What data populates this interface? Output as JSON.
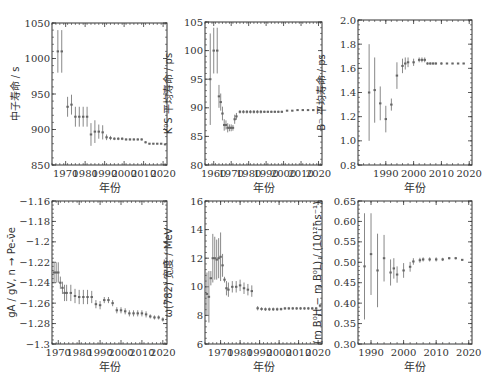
{
  "chart_data": [
    {
      "type": "scatter",
      "id": "neutron",
      "title": "",
      "xlabel": "年份",
      "ylabel": "中子寿命 / s",
      "xlim": [
        1963,
        2022
      ],
      "ylim": [
        850,
        1050
      ],
      "xticks": [
        1970,
        1980,
        1990,
        2000,
        2010,
        2020
      ],
      "yticks": [
        850,
        900,
        950,
        1000,
        1050
      ],
      "points": [
        {
          "x": 1966,
          "y": 1010,
          "err": 30
        },
        {
          "x": 1968,
          "y": 1010,
          "err": 30
        },
        {
          "x": 1971,
          "y": 932,
          "err": 14
        },
        {
          "x": 1973,
          "y": 935,
          "err": 14
        },
        {
          "x": 1975,
          "y": 918,
          "err": 14
        },
        {
          "x": 1977,
          "y": 918,
          "err": 14
        },
        {
          "x": 1979,
          "y": 918,
          "err": 14
        },
        {
          "x": 1981,
          "y": 918,
          "err": 14
        },
        {
          "x": 1983,
          "y": 893,
          "err": 16
        },
        {
          "x": 1985,
          "y": 897,
          "err": 16
        },
        {
          "x": 1987,
          "y": 897,
          "err": 10
        },
        {
          "x": 1989,
          "y": 896,
          "err": 10
        },
        {
          "x": 1991,
          "y": 889,
          "err": 4
        },
        {
          "x": 1993,
          "y": 888,
          "err": 3
        },
        {
          "x": 1995,
          "y": 887,
          "err": 2
        },
        {
          "x": 1997,
          "y": 887,
          "err": 2
        },
        {
          "x": 1999,
          "y": 887,
          "err": 2
        },
        {
          "x": 2001,
          "y": 886,
          "err": 1.5
        },
        {
          "x": 2003,
          "y": 886,
          "err": 1.5
        },
        {
          "x": 2005,
          "y": 886,
          "err": 1.5
        },
        {
          "x": 2007,
          "y": 886,
          "err": 1.5
        },
        {
          "x": 2009,
          "y": 886,
          "err": 1.5
        },
        {
          "x": 2011,
          "y": 882,
          "err": 1.5
        },
        {
          "x": 2013,
          "y": 880,
          "err": 1
        },
        {
          "x": 2015,
          "y": 880,
          "err": 1
        },
        {
          "x": 2017,
          "y": 880,
          "err": 1
        },
        {
          "x": 2019,
          "y": 880,
          "err": 1
        },
        {
          "x": 2021,
          "y": 879,
          "err": 0.6
        }
      ]
    },
    {
      "type": "scatter",
      "id": "ks",
      "title": "",
      "xlabel": "年份",
      "ylabel": "K⁰S 平均寿命 / ps",
      "xlim": [
        1955,
        2022
      ],
      "ylim": [
        80,
        105
      ],
      "xticks": [
        1960,
        1970,
        1980,
        1990,
        2000,
        2010,
        2020
      ],
      "yticks": [
        80,
        85,
        90,
        95,
        100,
        105
      ],
      "points": [
        {
          "x": 1958,
          "y": 95,
          "err": 8
        },
        {
          "x": 1960,
          "y": 100,
          "err": 4
        },
        {
          "x": 1962,
          "y": 100,
          "err": 4
        },
        {
          "x": 1963,
          "y": 92,
          "err": 2
        },
        {
          "x": 1964,
          "y": 91,
          "err": 1.5
        },
        {
          "x": 1965,
          "y": 89,
          "err": 1.2
        },
        {
          "x": 1966,
          "y": 87,
          "err": 1
        },
        {
          "x": 1967,
          "y": 87,
          "err": 0.8
        },
        {
          "x": 1968,
          "y": 86.5,
          "err": 0.8
        },
        {
          "x": 1969,
          "y": 86.5,
          "err": 0.6
        },
        {
          "x": 1970,
          "y": 86.5,
          "err": 0.6
        },
        {
          "x": 1971,
          "y": 86.5,
          "err": 0.5
        },
        {
          "x": 1972,
          "y": 88,
          "err": 0.8
        },
        {
          "x": 1973,
          "y": 88.5,
          "err": 0.6
        },
        {
          "x": 1975,
          "y": 89.3,
          "err": 0.3
        },
        {
          "x": 1977,
          "y": 89.3,
          "err": 0.3
        },
        {
          "x": 1979,
          "y": 89.3,
          "err": 0.3
        },
        {
          "x": 1981,
          "y": 89.3,
          "err": 0.3
        },
        {
          "x": 1983,
          "y": 89.3,
          "err": 0.3
        },
        {
          "x": 1985,
          "y": 89.3,
          "err": 0.3
        },
        {
          "x": 1987,
          "y": 89.3,
          "err": 0.3
        },
        {
          "x": 1989,
          "y": 89.3,
          "err": 0.2
        },
        {
          "x": 1991,
          "y": 89.3,
          "err": 0.2
        },
        {
          "x": 1993,
          "y": 89.3,
          "err": 0.2
        },
        {
          "x": 1995,
          "y": 89.3,
          "err": 0.2
        },
        {
          "x": 1997,
          "y": 89.3,
          "err": 0.2
        },
        {
          "x": 1999,
          "y": 89.3,
          "err": 0.2
        },
        {
          "x": 2002,
          "y": 89.5,
          "err": 0.1
        },
        {
          "x": 2005,
          "y": 89.5,
          "err": 0.1
        },
        {
          "x": 2008,
          "y": 89.6,
          "err": 0.1
        },
        {
          "x": 2011,
          "y": 89.6,
          "err": 0.1
        },
        {
          "x": 2014,
          "y": 89.6,
          "err": 0.1
        },
        {
          "x": 2017,
          "y": 89.6,
          "err": 0.1
        },
        {
          "x": 2020,
          "y": 89.6,
          "err": 0.1
        }
      ]
    },
    {
      "type": "scatter",
      "id": "bminus",
      "title": "",
      "xlabel": "年份",
      "ylabel": "B⁻ 平均寿命 / ps",
      "xlim": [
        1980,
        2021
      ],
      "ylim": [
        0.8,
        2.0
      ],
      "xticks": [
        1990,
        2000,
        2010,
        2020
      ],
      "yticks": [
        0.8,
        1.0,
        1.2,
        1.4,
        1.6,
        1.8,
        2.0
      ],
      "points": [
        {
          "x": 1984,
          "y": 1.4,
          "err": 0.4
        },
        {
          "x": 1986,
          "y": 1.42,
          "err": 0.27
        },
        {
          "x": 1988,
          "y": 1.31,
          "err": 0.14
        },
        {
          "x": 1990,
          "y": 1.18,
          "err": 0.11
        },
        {
          "x": 1992,
          "y": 1.3,
          "err": 0.05
        },
        {
          "x": 1994,
          "y": 1.54,
          "err": 0.11
        },
        {
          "x": 1996,
          "y": 1.62,
          "err": 0.06
        },
        {
          "x": 1997,
          "y": 1.64,
          "err": 0.05
        },
        {
          "x": 1998,
          "y": 1.65,
          "err": 0.04
        },
        {
          "x": 2000,
          "y": 1.65,
          "err": 0.03
        },
        {
          "x": 2002,
          "y": 1.67,
          "err": 0.02
        },
        {
          "x": 2003,
          "y": 1.67,
          "err": 0.02
        },
        {
          "x": 2004,
          "y": 1.67,
          "err": 0.02
        },
        {
          "x": 2005,
          "y": 1.64,
          "err": 0.01
        },
        {
          "x": 2006,
          "y": 1.64,
          "err": 0.01
        },
        {
          "x": 2007,
          "y": 1.64,
          "err": 0.01
        },
        {
          "x": 2008,
          "y": 1.64,
          "err": 0.01
        },
        {
          "x": 2010,
          "y": 1.64,
          "err": 0.01
        },
        {
          "x": 2012,
          "y": 1.64,
          "err": 0.005
        },
        {
          "x": 2014,
          "y": 1.64,
          "err": 0.005
        },
        {
          "x": 2016,
          "y": 1.64,
          "err": 0.005
        },
        {
          "x": 2018,
          "y": 1.64,
          "err": 0.005
        }
      ]
    },
    {
      "type": "scatter",
      "id": "gagv",
      "title": "",
      "xlabel": "年份",
      "ylabel": "gA / gV, n → Pe-ν̄e",
      "xlim": [
        1967,
        2022
      ],
      "ylim": [
        -1.3,
        -1.16
      ],
      "xticks": [
        1970,
        1980,
        1990,
        2000,
        2010,
        2020
      ],
      "yticks": [
        -1.3,
        -1.28,
        -1.26,
        -1.24,
        -1.22,
        -1.2,
        -1.18,
        -1.16
      ],
      "points": [
        {
          "x": 1968,
          "y": -1.23,
          "err": 0.01
        },
        {
          "x": 1969,
          "y": -1.23,
          "err": 0.01
        },
        {
          "x": 1970,
          "y": -1.23,
          "err": 0.01
        },
        {
          "x": 1971,
          "y": -1.24,
          "err": 0.006
        },
        {
          "x": 1972,
          "y": -1.245,
          "err": 0.006
        },
        {
          "x": 1973,
          "y": -1.25,
          "err": 0.008
        },
        {
          "x": 1974,
          "y": -1.25,
          "err": 0.008
        },
        {
          "x": 1976,
          "y": -1.25,
          "err": 0.008
        },
        {
          "x": 1978,
          "y": -1.253,
          "err": 0.007
        },
        {
          "x": 1980,
          "y": -1.254,
          "err": 0.007
        },
        {
          "x": 1982,
          "y": -1.254,
          "err": 0.007
        },
        {
          "x": 1984,
          "y": -1.254,
          "err": 0.007
        },
        {
          "x": 1986,
          "y": -1.254,
          "err": 0.006
        },
        {
          "x": 1988,
          "y": -1.261,
          "err": 0.004
        },
        {
          "x": 1990,
          "y": -1.262,
          "err": 0.004
        },
        {
          "x": 1992,
          "y": -1.257,
          "err": 0.003
        },
        {
          "x": 1994,
          "y": -1.257,
          "err": 0.003
        },
        {
          "x": 1996,
          "y": -1.26,
          "err": 0.003
        },
        {
          "x": 1998,
          "y": -1.267,
          "err": 0.003
        },
        {
          "x": 2000,
          "y": -1.267,
          "err": 0.003
        },
        {
          "x": 2002,
          "y": -1.268,
          "err": 0.003
        },
        {
          "x": 2004,
          "y": -1.27,
          "err": 0.003
        },
        {
          "x": 2006,
          "y": -1.27,
          "err": 0.003
        },
        {
          "x": 2008,
          "y": -1.27,
          "err": 0.003
        },
        {
          "x": 2010,
          "y": -1.27,
          "err": 0.003
        },
        {
          "x": 2012,
          "y": -1.271,
          "err": 0.003
        },
        {
          "x": 2014,
          "y": -1.273,
          "err": 0.002
        },
        {
          "x": 2016,
          "y": -1.274,
          "err": 0.002
        },
        {
          "x": 2018,
          "y": -1.274,
          "err": 0.002
        },
        {
          "x": 2020,
          "y": -1.276,
          "err": 0.002
        }
      ]
    },
    {
      "type": "scatter",
      "id": "omega",
      "title": "",
      "xlabel": "年份",
      "ylabel": "ω(782) 宽度 / MeV",
      "xlim": [
        1962,
        2022
      ],
      "ylim": [
        6,
        16
      ],
      "xticks": [
        1970,
        1980,
        1990,
        2000,
        2010,
        2020
      ],
      "yticks": [
        6,
        8,
        10,
        12,
        14,
        16
      ],
      "points": [
        {
          "x": 1963,
          "y": 9.5,
          "err": 1.5
        },
        {
          "x": 1964,
          "y": 9.3,
          "err": 1.8
        },
        {
          "x": 1965,
          "y": 10.6,
          "err": 0.5
        },
        {
          "x": 1966,
          "y": 12,
          "err": 1.7
        },
        {
          "x": 1967,
          "y": 12,
          "err": 1.5
        },
        {
          "x": 1968,
          "y": 11.9,
          "err": 1.4
        },
        {
          "x": 1969,
          "y": 12,
          "err": 1.4
        },
        {
          "x": 1970,
          "y": 12.1,
          "err": 1.7
        },
        {
          "x": 1971,
          "y": 11.5,
          "err": 0.8
        },
        {
          "x": 1972,
          "y": 10.5,
          "err": 0.2
        },
        {
          "x": 1973,
          "y": 9.9,
          "err": 0.5
        },
        {
          "x": 1974,
          "y": 9.8,
          "err": 0.5
        },
        {
          "x": 1976,
          "y": 10,
          "err": 0.4
        },
        {
          "x": 1978,
          "y": 10,
          "err": 0.4
        },
        {
          "x": 1980,
          "y": 10.1,
          "err": 0.4
        },
        {
          "x": 1982,
          "y": 9.9,
          "err": 0.4
        },
        {
          "x": 1984,
          "y": 9.8,
          "err": 0.4
        },
        {
          "x": 1986,
          "y": 9.7,
          "err": 0.4
        },
        {
          "x": 1989,
          "y": 8.5,
          "err": 0.15
        },
        {
          "x": 1991,
          "y": 8.45,
          "err": 0.12
        },
        {
          "x": 1993,
          "y": 8.43,
          "err": 0.12
        },
        {
          "x": 1995,
          "y": 8.43,
          "err": 0.12
        },
        {
          "x": 1997,
          "y": 8.43,
          "err": 0.12
        },
        {
          "x": 1999,
          "y": 8.43,
          "err": 0.12
        },
        {
          "x": 2001,
          "y": 8.44,
          "err": 0.1
        },
        {
          "x": 2003,
          "y": 8.49,
          "err": 0.1
        },
        {
          "x": 2005,
          "y": 8.49,
          "err": 0.1
        },
        {
          "x": 2007,
          "y": 8.49,
          "err": 0.1
        },
        {
          "x": 2009,
          "y": 8.49,
          "err": 0.1
        },
        {
          "x": 2011,
          "y": 8.49,
          "err": 0.1
        },
        {
          "x": 2013,
          "y": 8.49,
          "err": 0.1
        },
        {
          "x": 2015,
          "y": 8.49,
          "err": 0.1
        },
        {
          "x": 2017,
          "y": 8.49,
          "err": 0.1
        },
        {
          "x": 2019,
          "y": 8.49,
          "err": 0.1
        },
        {
          "x": 2021,
          "y": 8.68,
          "err": 0.13
        }
      ]
    },
    {
      "type": "scatter",
      "id": "bd",
      "title": "",
      "xlabel": "年份",
      "ylabel": "(m B⁰H − m B⁰L) / (10¹²ħs⁻¹)",
      "xlim": [
        1986,
        2021
      ],
      "ylim": [
        0.3,
        0.65
      ],
      "xticks": [
        1990,
        2000,
        2010,
        2020
      ],
      "yticks": [
        0.3,
        0.35,
        0.4,
        0.45,
        0.5,
        0.55,
        0.6,
        0.65
      ],
      "points": [
        {
          "x": 1988,
          "y": 0.49,
          "err": 0.13
        },
        {
          "x": 1990,
          "y": 0.52,
          "err": 0.1
        },
        {
          "x": 1992,
          "y": 0.48,
          "err": 0.09
        },
        {
          "x": 1994,
          "y": 0.51,
          "err": 0.057
        },
        {
          "x": 1996,
          "y": 0.475,
          "err": 0.032
        },
        {
          "x": 1997,
          "y": 0.485,
          "err": 0.025
        },
        {
          "x": 1998,
          "y": 0.47,
          "err": 0.02
        },
        {
          "x": 2000,
          "y": 0.48,
          "err": 0.018
        },
        {
          "x": 2002,
          "y": 0.489,
          "err": 0.012
        },
        {
          "x": 2003,
          "y": 0.502,
          "err": 0.008
        },
        {
          "x": 2005,
          "y": 0.505,
          "err": 0.006
        },
        {
          "x": 2006,
          "y": 0.507,
          "err": 0.005
        },
        {
          "x": 2008,
          "y": 0.507,
          "err": 0.005
        },
        {
          "x": 2010,
          "y": 0.507,
          "err": 0.005
        },
        {
          "x": 2012,
          "y": 0.507,
          "err": 0.004
        },
        {
          "x": 2014,
          "y": 0.51,
          "err": 0.003
        },
        {
          "x": 2016,
          "y": 0.51,
          "err": 0.003
        },
        {
          "x": 2018,
          "y": 0.506,
          "err": 0.002
        }
      ]
    }
  ],
  "layout": {
    "frames": [
      {
        "x": 52,
        "y": 23,
        "w": 115,
        "h": 142
      },
      {
        "x": 205,
        "y": 22,
        "w": 117,
        "h": 143
      },
      {
        "x": 358,
        "y": 20,
        "w": 114,
        "h": 145
      },
      {
        "x": 52,
        "y": 201,
        "w": 115,
        "h": 143
      },
      {
        "x": 205,
        "y": 201,
        "w": 117,
        "h": 143
      },
      {
        "x": 358,
        "y": 201,
        "w": 114,
        "h": 143
      }
    ],
    "colors": {
      "frame": "#333333",
      "errorbar": "#888888",
      "marker": "#666666",
      "text": "#333333"
    }
  }
}
